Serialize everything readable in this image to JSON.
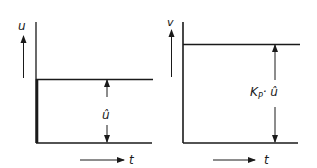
{
  "colors": {
    "line": "#1a1a1a",
    "background": "#ffffff"
  },
  "left_panel": {
    "y_axis_label": "u",
    "x_axis_label": "t",
    "dimension_label": "û"
  },
  "right_panel": {
    "y_axis_label": "v",
    "x_axis_label": "t",
    "dimension_label_main": "K",
    "dimension_label_sub": "P",
    "dimension_label_tail": "· û"
  }
}
